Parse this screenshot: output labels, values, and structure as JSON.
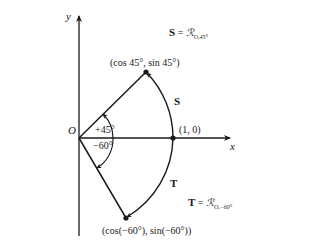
{
  "axes": {
    "x_label": "x",
    "y_label": "y",
    "origin_label": "O"
  },
  "points": {
    "p45": "(cos 45°, sin 45°)",
    "p0": "(1, 0)",
    "pm60": "(cos(−60°), sin(−60°))"
  },
  "angles": {
    "pos": "+45°",
    "neg": "−60°"
  },
  "arcs": {
    "s_label": "S",
    "t_label": "T"
  },
  "equations": {
    "s_lhs": "S",
    "s_eq": "=",
    "s_rot": "ℛ",
    "s_sub": "O,45°",
    "t_lhs": "T",
    "t_eq": "=",
    "t_rot": "ℛ",
    "t_sub": "O,−60°"
  }
}
